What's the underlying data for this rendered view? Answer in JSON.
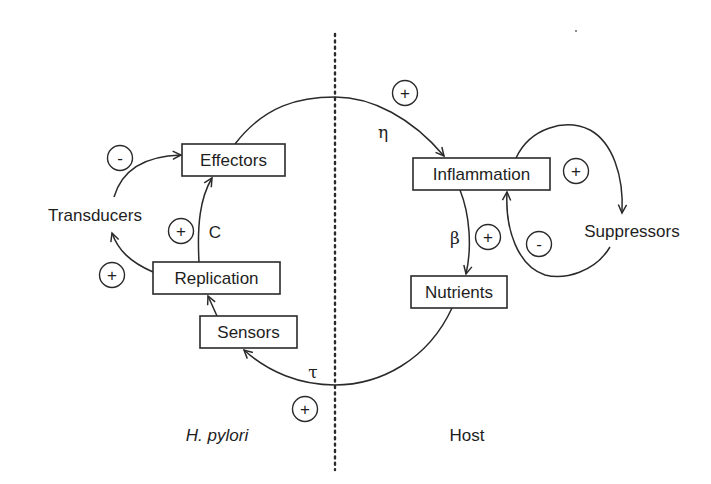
{
  "diagram": {
    "nodes": {
      "effectors": "Effectors",
      "replication": "Replication",
      "sensors": "Sensors",
      "inflammation": "Inflammation",
      "nutrients": "Nutrients"
    },
    "free_labels": {
      "transducers": "Transducers",
      "suppressors": "Suppressors"
    },
    "parameters": {
      "eta": "η",
      "beta": "β",
      "tau": "τ",
      "c": "C"
    },
    "signs": {
      "transducers_to_effectors": "-",
      "replication_to_effectors": "+",
      "replication_to_transducers": "+",
      "effectors_to_inflammation": "+",
      "inflammation_to_suppressors": "+",
      "inflammation_to_nutrients": "+",
      "suppressors_to_inflammation": "-",
      "nutrients_to_sensors": "+"
    },
    "regions": {
      "left": "H. pylori",
      "right": "Host"
    },
    "colors": {
      "ink": "#1e1e1e",
      "background": "#ffffff"
    }
  }
}
